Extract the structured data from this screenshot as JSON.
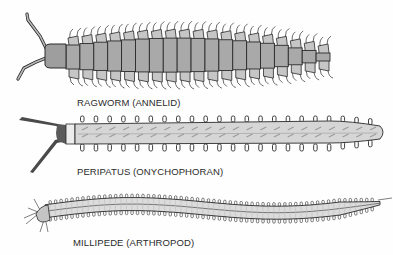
{
  "figure": {
    "background": "#fefefe",
    "ink_color": "#2a2a2a",
    "body_fill_dark": "#a8a8a8",
    "body_fill_light": "#d9d9d9",
    "specimens": [
      {
        "id": "ragworm",
        "label": "RAGWORM (ANNELID)",
        "segments": 19
      },
      {
        "id": "peripatus",
        "label": "PERIPATUS (ONYCHOPHORAN)",
        "leg_pairs": 22
      },
      {
        "id": "millipede",
        "label": "MILLIPEDE (ARTHROPOD)",
        "leg_count_per_side": 60
      }
    ]
  }
}
